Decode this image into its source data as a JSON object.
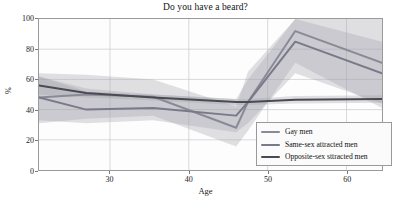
{
  "chart_data": {
    "type": "line",
    "title": "Do you have a beard?",
    "xlabel": "Age",
    "ylabel": "%",
    "xlim": [
      21,
      64.5
    ],
    "ylim": [
      0,
      100
    ],
    "grid": true,
    "legend_position": "lower right",
    "xticks": [
      30,
      40,
      50,
      60
    ],
    "yticks": [
      0,
      20,
      40,
      60,
      80,
      100
    ],
    "xtick_labels": [
      "30",
      "40",
      "50",
      "60"
    ],
    "ytick_labels": [
      "0",
      "20",
      "40",
      "60",
      "80",
      "100"
    ],
    "series": [
      {
        "name": "Gay men",
        "color": "#8a8a96",
        "x": [
          21,
          27,
          35.5,
          46,
          47.5,
          53.5,
          64.5
        ],
        "values": [
          48,
          50,
          48.5,
          28,
          45,
          92,
          71
        ],
        "band_low": [
          31,
          34,
          36,
          15.5,
          26,
          71,
          41
        ],
        "band_high": [
          64,
          63,
          60,
          42,
          65,
          100,
          100
        ]
      },
      {
        "name": "Same-sex attracted men",
        "color": "#79798a",
        "x": [
          21,
          27,
          35.5,
          46,
          47.5,
          53.5,
          64.5
        ],
        "values": [
          48,
          40,
          41,
          36,
          45,
          85,
          64
        ],
        "band_low": [
          33,
          31,
          33,
          25,
          31,
          64,
          44
        ],
        "band_high": [
          62,
          52,
          50,
          47,
          60,
          100,
          85
        ]
      },
      {
        "name": "Opposite-sex sttracted men",
        "color": "#4a4a52",
        "x": [
          21,
          27,
          35.5,
          46,
          47.5,
          53.5,
          64.5
        ],
        "values": [
          56,
          51,
          48,
          45,
          45,
          46.5,
          47
        ],
        "band_low": [
          50,
          48,
          46,
          43,
          43,
          44,
          44.5
        ],
        "band_high": [
          62,
          54,
          50,
          47,
          47,
          49,
          49.5
        ]
      }
    ]
  },
  "legend": {
    "entries": [
      {
        "label": "Gay men"
      },
      {
        "label": "Same-sex attracted men"
      },
      {
        "label": "Opposite-sex sttracted men"
      }
    ]
  },
  "colors": {
    "grid": "#c9c9cf",
    "axis": "#9a9a9a",
    "band_fill": "#9b9ba6",
    "plot_background": "#fdfdfd",
    "figure_background": "#ffffff"
  }
}
